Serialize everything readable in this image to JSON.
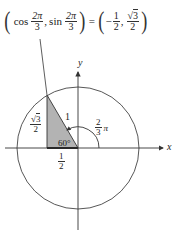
{
  "formula": {
    "lhs_open": "(",
    "cos_fn": "cos",
    "cos_arg_num": "2π",
    "cos_arg_den": "3",
    "comma1": ",",
    "sin_fn": "sin",
    "sin_arg_num": "2π",
    "sin_arg_den": "3",
    "lhs_close": ")",
    "equals": "=",
    "rhs_open": "(",
    "x_sign": "−",
    "x_num": "1",
    "x_den": "2",
    "comma2": ",",
    "y_sqrt": "√",
    "y_num_radicand": "3",
    "y_den": "2",
    "rhs_close": ")"
  },
  "axes": {
    "x_label": "x",
    "y_label": "y"
  },
  "triangle": {
    "hypotenuse_label": "1",
    "angle_label": "60°",
    "height_label_sqrt": "√",
    "height_label_radicand": "3",
    "height_label_den": "2",
    "base_label_num": "1",
    "base_label_den": "2",
    "fill_color": "#b3b3b3"
  },
  "arc": {
    "angle_label_num": "2",
    "angle_label_den": "3",
    "angle_label_suffix": "π"
  },
  "geometry": {
    "origin_x": 78,
    "origin_y": 148,
    "radius": 61,
    "point_angle_deg": 120
  },
  "colors": {
    "line": "#333333",
    "circle": "#444444",
    "triangle_fill": "#b3b3b3"
  }
}
